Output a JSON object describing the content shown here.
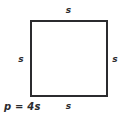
{
  "figure": {
    "type": "geometry-diagram",
    "shape": "square",
    "background_color": "#ffffff",
    "stroke_color": "#2b2b2e",
    "text_color": "#2b2b2e",
    "labels": {
      "top_side": "s",
      "right_side": "s",
      "bottom_side": "s",
      "left_side": "s"
    },
    "formula": "p = 4s"
  }
}
